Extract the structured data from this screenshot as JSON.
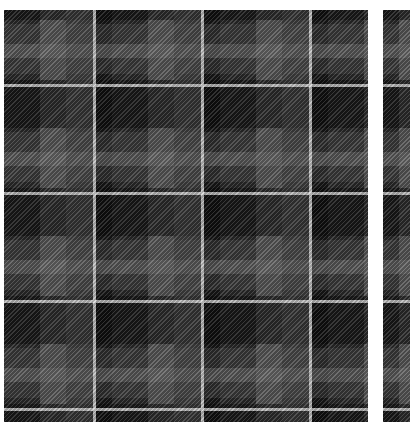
{
  "image": {
    "description": "Grayscale tartan plaid fabric swatches with diagonal twill texture",
    "panels": [
      {
        "id": "main",
        "label": "Tartan swatch (main)"
      },
      {
        "id": "side",
        "label": "Tartan swatch (partial, right edge)"
      }
    ],
    "colors": {
      "background": "#ffffff",
      "ground": "#2a2a2a",
      "light_band": "#7a7a7a",
      "dark_block": "#0a0a0a",
      "pinstripe": "#e1e1e1"
    },
    "pattern": {
      "repeat_px": 108,
      "texture": "diagonal twill"
    }
  }
}
